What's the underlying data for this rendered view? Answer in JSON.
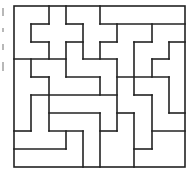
{
  "diagram": {
    "type": "polyomino-tiling-puzzle",
    "stroke_color": "#222222",
    "background": "#ffffff",
    "frame": {
      "x": 14,
      "y": 6,
      "width": 171,
      "height": 161
    },
    "segments": [
      [
        49,
        6,
        49,
        24
      ],
      [
        31,
        24,
        49,
        24
      ],
      [
        31,
        24,
        31,
        42
      ],
      [
        31,
        42,
        49,
        42
      ],
      [
        49,
        42,
        49,
        59
      ],
      [
        66,
        6,
        66,
        24
      ],
      [
        66,
        24,
        83,
        24
      ],
      [
        83,
        24,
        83,
        59
      ],
      [
        83,
        59,
        117,
        59
      ],
      [
        100,
        6,
        100,
        24
      ],
      [
        100,
        24,
        185,
        24
      ],
      [
        117,
        24,
        117,
        42
      ],
      [
        100,
        42,
        117,
        42
      ],
      [
        100,
        42,
        100,
        59
      ],
      [
        66,
        42,
        83,
        42
      ],
      [
        66,
        42,
        66,
        77
      ],
      [
        66,
        77,
        100,
        77
      ],
      [
        100,
        77,
        100,
        95
      ],
      [
        31,
        95,
        117,
        95
      ],
      [
        14,
        59,
        66,
        59
      ],
      [
        31,
        59,
        31,
        77
      ],
      [
        31,
        77,
        49,
        77
      ],
      [
        49,
        77,
        49,
        131
      ],
      [
        117,
        59,
        117,
        131
      ],
      [
        117,
        77,
        169,
        77
      ],
      [
        152,
        24,
        152,
        42
      ],
      [
        134,
        42,
        152,
        42
      ],
      [
        134,
        42,
        134,
        95
      ],
      [
        134,
        95,
        152,
        95
      ],
      [
        152,
        95,
        152,
        149
      ],
      [
        134,
        149,
        152,
        149
      ],
      [
        134,
        113,
        134,
        167
      ],
      [
        117,
        113,
        134,
        113
      ],
      [
        169,
        42,
        185,
        42
      ],
      [
        169,
        42,
        169,
        59
      ],
      [
        152,
        59,
        169,
        59
      ],
      [
        152,
        59,
        152,
        77
      ],
      [
        169,
        77,
        169,
        113
      ],
      [
        169,
        113,
        185,
        113
      ],
      [
        152,
        131,
        185,
        131
      ],
      [
        100,
        113,
        100,
        167
      ],
      [
        100,
        131,
        117,
        131
      ],
      [
        49,
        113,
        100,
        113
      ],
      [
        31,
        95,
        31,
        131
      ],
      [
        14,
        131,
        31,
        131
      ],
      [
        49,
        131,
        83,
        131
      ],
      [
        66,
        131,
        66,
        149
      ],
      [
        14,
        149,
        66,
        149
      ],
      [
        83,
        131,
        83,
        167
      ]
    ]
  },
  "margin_marks": [
    {
      "height": 8
    },
    {
      "height": 4
    },
    {
      "height": 6
    },
    {
      "height": 9
    }
  ]
}
